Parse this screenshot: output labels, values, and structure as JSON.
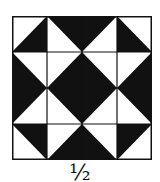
{
  "figure": {
    "caption": "½",
    "grid": {
      "rows": 4,
      "cols": 4
    },
    "colors": {
      "dark": "#111111",
      "light": "#ffffff",
      "line": "#111111"
    },
    "cells": [
      [
        {
          "diag": "tr-bl",
          "dark": "br"
        },
        {
          "diag": "tl-br",
          "dark": "tr"
        },
        {
          "diag": "tr-bl",
          "dark": "tl"
        },
        {
          "diag": "tl-br",
          "dark": "bl"
        }
      ],
      [
        {
          "diag": "tl-br",
          "dark": "bl"
        },
        {
          "diag": "tr-bl",
          "dark": "br"
        },
        {
          "diag": "tl-br",
          "dark": "bl"
        },
        {
          "diag": "tr-bl",
          "dark": "br"
        }
      ],
      [
        {
          "diag": "tr-bl",
          "dark": "tl"
        },
        {
          "diag": "tl-br",
          "dark": "tr"
        },
        {
          "diag": "tr-bl",
          "dark": "tl"
        },
        {
          "diag": "tl-br",
          "dark": "tr"
        }
      ],
      [
        {
          "diag": "tl-br",
          "dark": "tr"
        },
        {
          "diag": "tr-bl",
          "dark": "br"
        },
        {
          "diag": "tl-br",
          "dark": "bl"
        },
        {
          "diag": "tr-bl",
          "dark": "tl"
        }
      ]
    ]
  }
}
